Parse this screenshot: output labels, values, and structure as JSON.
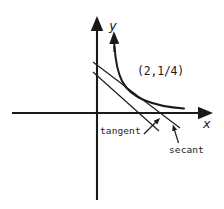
{
  "figure": {
    "axes": {
      "x_label": "x",
      "y_label": "y",
      "origin": {
        "x": 97,
        "y": 113
      },
      "x_axis_from": {
        "x": 12,
        "y": 113
      },
      "x_axis_to": {
        "x": 207,
        "y": 113
      },
      "y_axis_from": {
        "x": 97,
        "y": 200
      },
      "y_axis_to": {
        "x": 97,
        "y": 22
      },
      "arrowheads": [
        "x-positive",
        "y-positive"
      ],
      "tick_labels": [],
      "grid": false
    },
    "curve": {
      "name": "curve",
      "description": "decreasing convex curve approaching both axes",
      "arrowhead": "top",
      "points": [
        {
          "x": 114,
          "y": 42
        },
        {
          "x": 116,
          "y": 55
        },
        {
          "x": 119,
          "y": 67
        },
        {
          "x": 124,
          "y": 78
        },
        {
          "x": 131,
          "y": 87
        },
        {
          "x": 140,
          "y": 94
        },
        {
          "x": 152,
          "y": 100
        },
        {
          "x": 166,
          "y": 105
        },
        {
          "x": 183,
          "y": 108
        }
      ]
    },
    "lines": [
      {
        "name": "tangent",
        "label": "tangent",
        "from": {
          "x": 93,
          "y": 72
        },
        "to": {
          "x": 159,
          "y": 131
        }
      },
      {
        "name": "secant",
        "label": "secant",
        "from": {
          "x": 93,
          "y": 62
        },
        "to": {
          "x": 180,
          "y": 128
        }
      }
    ],
    "point": {
      "label": "(2,1/4)",
      "at": {
        "x": 135,
        "y": 90
      }
    },
    "pointers": [
      {
        "name": "tangent-pointer",
        "from": {
          "x": 145,
          "y": 133
        },
        "to": {
          "x": 157,
          "y": 122
        }
      },
      {
        "name": "secant-pointer",
        "from": {
          "x": 177,
          "y": 143
        },
        "to": {
          "x": 174,
          "y": 130
        }
      }
    ],
    "colors": {
      "ink": "#1a1a1a",
      "background": "#ffffff"
    }
  }
}
